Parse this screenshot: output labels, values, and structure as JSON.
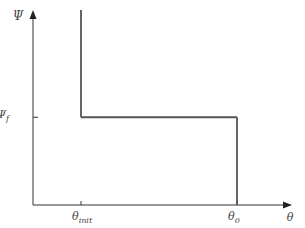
{
  "chart_data": {
    "type": "line",
    "title": "",
    "xlabel": "θ",
    "ylabel": "Ψ",
    "x_ticks": [
      {
        "label_main": "θ",
        "label_sub": "init",
        "value": 0.3
      },
      {
        "label_main": "θ",
        "label_sub": "0",
        "value": 0.8
      }
    ],
    "y_ticks": [
      {
        "label_main": "Ψ",
        "label_sub": "f",
        "value": 0.45
      }
    ],
    "series": [
      {
        "name": "path",
        "points": [
          [
            0.3,
            1.0
          ],
          [
            0.3,
            0.45
          ],
          [
            0.8,
            0.45
          ],
          [
            0.8,
            0.0
          ]
        ]
      }
    ],
    "xlim": [
      0,
      1
    ],
    "ylim": [
      0,
      1
    ],
    "grid": false,
    "colors": {
      "axis": "#333333",
      "line": "#555555",
      "text": "#444444"
    }
  }
}
